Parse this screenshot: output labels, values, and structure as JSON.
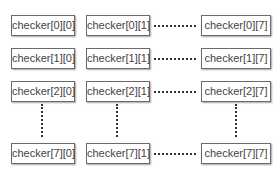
{
  "diagram": {
    "rows": [
      {
        "index": 0,
        "cells": [
          "checker[0][0]",
          "checker[0][1]",
          "checker[0][7]"
        ]
      },
      {
        "index": 1,
        "cells": [
          "checker[1][0]",
          "checker[1][1]",
          "checker[1][7]"
        ]
      },
      {
        "index": 2,
        "cells": [
          "checker[2][0]",
          "checker[2][1]",
          "checker[2][7]"
        ]
      },
      {
        "index": 7,
        "cells": [
          "checker[7][0]",
          "checker[7][1]",
          "checker[7][7]"
        ]
      }
    ],
    "connectors": {
      "horizontal": "dotted ellipsis between column 1 and column 7",
      "vertical": "dotted ellipsis between row 2 and row 7"
    },
    "colors": {
      "border": "#6a6a6a",
      "text": "#444444",
      "dots": "#333333"
    }
  }
}
